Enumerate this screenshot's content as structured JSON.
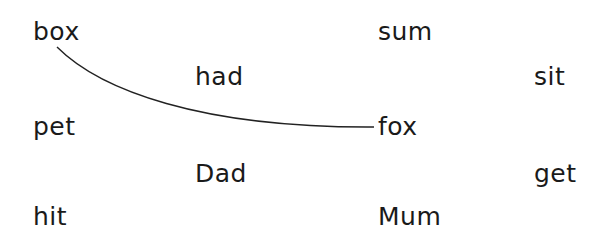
{
  "worksheet": {
    "words": [
      {
        "id": "box",
        "text": "box",
        "x": 33,
        "y": 19
      },
      {
        "id": "had",
        "text": "had",
        "x": 195,
        "y": 64
      },
      {
        "id": "pet",
        "text": "pet",
        "x": 33,
        "y": 114
      },
      {
        "id": "dad",
        "text": "Dad",
        "x": 195,
        "y": 161
      },
      {
        "id": "hit",
        "text": "hit",
        "x": 33,
        "y": 204
      },
      {
        "id": "sum",
        "text": "sum",
        "x": 378,
        "y": 19
      },
      {
        "id": "fox",
        "text": "fox",
        "x": 378,
        "y": 114
      },
      {
        "id": "mum",
        "text": "Mum",
        "x": 378,
        "y": 204
      },
      {
        "id": "sit",
        "text": "sit",
        "x": 534,
        "y": 64
      },
      {
        "id": "get",
        "text": "get",
        "x": 534,
        "y": 161
      }
    ],
    "connections": [
      {
        "from": "box",
        "to": "fox",
        "path": "M57,47 C100,90 200,128 374,127"
      }
    ],
    "line_color": "#222222"
  }
}
